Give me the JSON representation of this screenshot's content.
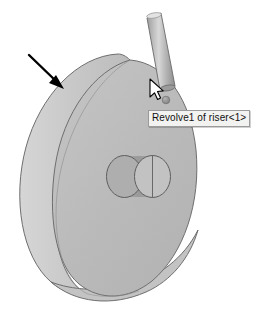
{
  "viewport": {
    "width": 258,
    "height": 320,
    "background_color": "#ffffff"
  },
  "model_view": {
    "name": "solidworks-3d-model-view",
    "parts": [
      {
        "id": "disc",
        "label": "riser disc body",
        "type": "revolved-disc",
        "face_color": "#bdbdbd",
        "rim_color": "#cacaca",
        "edge_color": "#6e6e6e"
      },
      {
        "id": "hub",
        "label": "central hub cylinder",
        "type": "cylinder",
        "near_face_color": "#b0b0b0",
        "far_face_color": "#c0c0c0",
        "body_color": "#9d9d9d",
        "edge_color": "#5e5e5e"
      },
      {
        "id": "riser-shaft",
        "label": "riser shaft cylinder",
        "type": "cylinder",
        "highlight_color": "#d6d6d6",
        "body_color": "#a8a8a8",
        "shade_color": "#8f8f8f",
        "edge_color": "#6a6a6a"
      }
    ]
  },
  "annotations": {
    "leader_arrow": {
      "name": "pointer-arrow-annotation",
      "color": "#000000",
      "from": {
        "x": 30,
        "y": 56
      },
      "to": {
        "x": 62,
        "y": 87
      }
    },
    "selection_dot": {
      "name": "selection-point-marker",
      "color": "#8c8c8c",
      "x": 166,
      "y": 100,
      "radius": 3.6
    },
    "cursor": {
      "name": "mouse-cursor-arrow",
      "fill": "#ffffff",
      "stroke": "#000000",
      "x": 151,
      "y": 84
    }
  },
  "tooltip": {
    "name": "feature-name-tooltip",
    "text": "Revolve1 of riser<1>",
    "background_color": "#f2f2f0",
    "border_color": "#9a9a9a",
    "text_color": "#111111"
  }
}
